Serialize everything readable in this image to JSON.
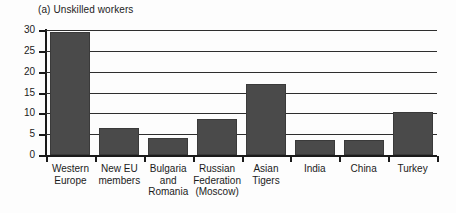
{
  "chart_data": {
    "type": "bar",
    "title": "(a) Unskilled workers",
    "xlabel": "",
    "ylabel": "",
    "ylim": [
      0,
      30
    ],
    "yticks": [
      0,
      5,
      10,
      15,
      20,
      25,
      30
    ],
    "grid": true,
    "legend": false,
    "categories": [
      "Western\nEurope",
      "New EU\nmembers",
      "Bulgaria\nand\nRomania",
      "Russian\nFederation\n(Moscow)",
      "Asian\nTigers",
      "India",
      "China",
      "Turkey"
    ],
    "values": [
      29.5,
      6.5,
      4.0,
      8.6,
      17.0,
      3.6,
      3.5,
      10.3
    ],
    "bar_color": "#4a4a4a",
    "axis_color": "#1a1a1a",
    "grid_color": "#2e2e2e"
  },
  "axis": {
    "y_tick_labels": [
      "30",
      "25",
      "20",
      "15",
      "10",
      "5",
      "0"
    ]
  }
}
